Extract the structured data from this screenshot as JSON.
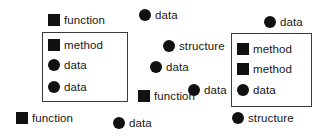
{
  "diagram": {
    "canvas": {
      "width": 322,
      "height": 139,
      "background": "#ffffff"
    },
    "marker_colors": {
      "fill": "#111111",
      "box_border": "#3a3a3a",
      "label": "#161616"
    },
    "marker_legend": {
      "square": "square-marker",
      "circle": "circle-marker"
    },
    "groups": [
      {
        "name": "left-group-box",
        "x": 42,
        "y": 32,
        "width": 86,
        "height": 70
      },
      {
        "name": "right-group-box",
        "x": 231,
        "y": 33,
        "width": 81,
        "height": 74
      }
    ],
    "nodes": [
      {
        "label": "function",
        "shape": "square",
        "x": 48,
        "y": 14
      },
      {
        "label": "data",
        "shape": "circle",
        "x": 139,
        "y": 9
      },
      {
        "label": "data",
        "shape": "circle",
        "x": 264,
        "y": 16
      },
      {
        "label": "method",
        "shape": "square",
        "x": 48,
        "y": 39
      },
      {
        "label": "structure",
        "shape": "circle",
        "x": 163,
        "y": 40
      },
      {
        "label": "method",
        "shape": "square",
        "x": 237,
        "y": 43
      },
      {
        "label": "data",
        "shape": "circle",
        "x": 48,
        "y": 59
      },
      {
        "label": "data",
        "shape": "circle",
        "x": 150,
        "y": 61
      },
      {
        "label": "method",
        "shape": "square",
        "x": 237,
        "y": 63
      },
      {
        "label": "data",
        "shape": "circle",
        "x": 48,
        "y": 81
      },
      {
        "label": "data",
        "shape": "circle",
        "x": 188,
        "y": 84
      },
      {
        "label": "data",
        "shape": "circle",
        "x": 237,
        "y": 84
      },
      {
        "label": "function",
        "shape": "square",
        "x": 138,
        "y": 90
      },
      {
        "label": "function",
        "shape": "square",
        "x": 16,
        "y": 112
      },
      {
        "label": "data",
        "shape": "circle",
        "x": 113,
        "y": 117
      },
      {
        "label": "structure",
        "shape": "circle",
        "x": 232,
        "y": 112
      }
    ]
  }
}
